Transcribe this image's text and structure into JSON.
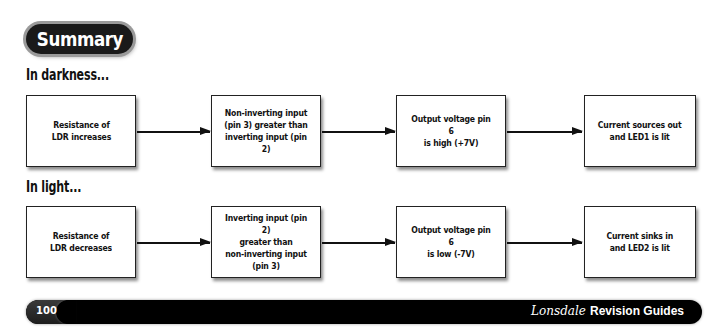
{
  "header": {
    "badge_label": "Summary"
  },
  "sections": [
    {
      "title": "In darkness...",
      "steps": [
        "Resistance of\nLDR increases",
        "Non-inverting input\n(pin 3) greater than\ninverting input (pin 2)",
        "Output voltage pin 6\nis high (+7V)",
        "Current sources out\nand LED1 is lit"
      ]
    },
    {
      "title": "In light...",
      "steps": [
        "Resistance of\nLDR decreases",
        "Inverting input (pin 2)\ngreater than\nnon-inverting input (pin 3)",
        "Output voltage pin 6\nis low (-7V)",
        "Current sinks in\nand LED2 is lit"
      ]
    }
  ],
  "footer": {
    "page_number": "100",
    "brand_script": "Lonsdale",
    "brand_text": "Revision Guides"
  },
  "colors": {
    "badge_bg": "#1a1a1a",
    "footer_bg": "#000000",
    "box_border": "#222222"
  }
}
